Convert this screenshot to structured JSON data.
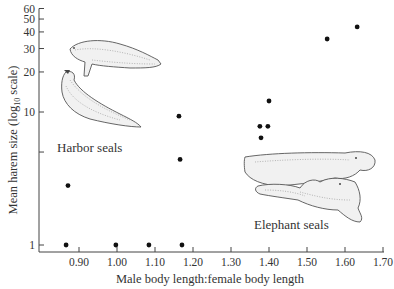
{
  "chart_data": {
    "type": "scatter",
    "title": "",
    "xlabel": "Male body length:female body length",
    "ylabel": "Mean harem size (log",
    "ylabel_subscript": "10",
    "ylabel_suffix": " scale)",
    "yscale": "log10",
    "xlim": [
      0.83,
      1.7
    ],
    "ylim": [
      0.95,
      60
    ],
    "x_ticks": [
      0.9,
      1.0,
      1.1,
      1.2,
      1.3,
      1.4,
      1.5,
      1.6,
      1.7
    ],
    "x_tick_labels": [
      "0.90",
      "1.00",
      "1.10",
      "1.20",
      "1.30",
      "1.40",
      "1.50",
      "1.60",
      "1.70"
    ],
    "y_ticks": [
      1,
      5,
      10,
      20,
      30,
      40,
      50,
      60
    ],
    "y_tick_labels": [
      "1",
      "",
      "10",
      "20",
      "30",
      "40",
      "50",
      "60"
    ],
    "grid": false,
    "points": [
      {
        "x": 0.866,
        "y": 1.0
      },
      {
        "x": 0.871,
        "y": 2.8
      },
      {
        "x": 0.997,
        "y": 1.0
      },
      {
        "x": 1.084,
        "y": 1.0
      },
      {
        "x": 1.163,
        "y": 9.3
      },
      {
        "x": 1.166,
        "y": 4.4
      },
      {
        "x": 1.171,
        "y": 1.0
      },
      {
        "x": 1.376,
        "y": 7.8
      },
      {
        "x": 1.379,
        "y": 6.4
      },
      {
        "x": 1.397,
        "y": 7.8
      },
      {
        "x": 1.4,
        "y": 12.1
      },
      {
        "x": 1.553,
        "y": 35.4
      },
      {
        "x": 1.632,
        "y": 43.6
      }
    ],
    "annotations": [
      {
        "text": "Harbor seals",
        "near": "upper-left",
        "illustration": "harbor-seals"
      },
      {
        "text": "Elephant seals",
        "near": "lower-right",
        "illustration": "elephant-seals"
      }
    ]
  }
}
